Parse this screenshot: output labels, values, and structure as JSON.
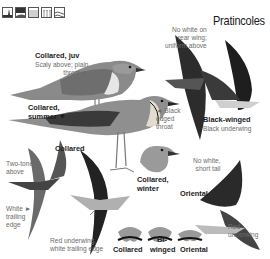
{
  "page": {
    "title": "Pratincoles",
    "habitat_icons": [
      "wetland-marsh-icon",
      "coast-grassland-icon",
      "farmland-icon",
      "reedbed-icon",
      "open-water-icon"
    ]
  },
  "labels": {
    "collared_juv": {
      "name": "Collared, juv",
      "note_line1": "Scaly above; plain",
      "note_line2": "throat ►"
    },
    "rear_wing": {
      "line1": "No white on",
      "line2": "rear wing;",
      "line3": "uniform above"
    },
    "collared_summer": {
      "line1": "Collared,",
      "line2": "summer ▼"
    },
    "black_edged": {
      "line1": "◄ Black",
      "line2": "edged",
      "line3": "throat"
    },
    "black_winged": {
      "name": "Black-winged",
      "note": "Black underwing"
    },
    "collared_flight": {
      "name": "Collared"
    },
    "two_tone": {
      "line1": "Two-tone",
      "line2": "above"
    },
    "white_trailing": {
      "line1": "White ►",
      "line2": "trailing",
      "line3": "edge"
    },
    "collared_winter": {
      "line1": "Collared,",
      "line2": "winter"
    },
    "no_white_short_tail": {
      "line1": "No white,",
      "line2": "short tail"
    },
    "oriental": {
      "name": "Oriental"
    },
    "red_underwing_white": {
      "line1": "Red underwing,",
      "line2": "white trailing edge"
    },
    "red_underwing": {
      "line1": "Red",
      "line2": "underwing"
    },
    "tail_collared": "Collared",
    "tail_bi": "Bi-",
    "tail_winged": "winged",
    "tail_oriental": "Oriental"
  },
  "colors": {
    "ink": "#1c1c1c",
    "note": "#6b6b6b",
    "bird_dark": "#2a2a2a",
    "bird_mid": "#7a7a7a",
    "bird_light": "#b5b5b5"
  }
}
